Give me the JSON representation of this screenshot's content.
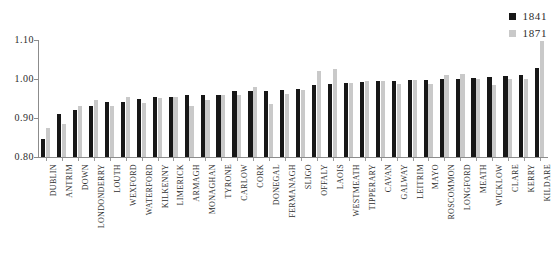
{
  "legend": {
    "position": "top-right",
    "items": [
      {
        "label": "1841",
        "color": "#171717",
        "name": "series-1841"
      },
      {
        "label": "1871",
        "color": "#c9c9c9",
        "name": "series-1871"
      }
    ]
  },
  "axis": {
    "y_ticks": [
      "1.10",
      "1.00",
      "0.90",
      "0.80"
    ],
    "y_min": 0.8,
    "y_max": 1.1
  },
  "chart_data": {
    "type": "bar",
    "title": "",
    "subtitle": "",
    "xlabel": "",
    "ylabel": "",
    "ylim": [
      0.8,
      1.1
    ],
    "grid": false,
    "legend_position": "top right",
    "categories": [
      "DUBLIN",
      "ANTRIM",
      "DOWN",
      "LONDONDERRY",
      "LOUTH",
      "WEXFORD",
      "WATERFORD",
      "KILKENNY",
      "LIMERICK",
      "ARMAGH",
      "MONAGHAN",
      "TYRONE",
      "CARLOW",
      "CORK",
      "DONEGAL",
      "FERMANAGH",
      "SLIGO",
      "OFFALY",
      "LAOIS",
      "WESTMEATH",
      "TIPPERARY",
      "CAVAN",
      "GALWAY",
      "LEITRIM",
      "MAYO",
      "ROSCOMMON",
      "LONGFORD",
      "MEATH",
      "WICKLOW",
      "CLARE",
      "KERRY",
      "KILDARE"
    ],
    "series": [
      {
        "name": "1841",
        "color": "#171717",
        "values": [
          0.845,
          0.91,
          0.92,
          0.93,
          0.94,
          0.94,
          0.95,
          0.955,
          0.955,
          0.958,
          0.96,
          0.96,
          0.968,
          0.97,
          0.97,
          0.972,
          0.975,
          0.985,
          0.988,
          0.99,
          0.992,
          0.995,
          0.995,
          0.998,
          0.998,
          1.0,
          1.0,
          1.002,
          1.005,
          1.008,
          1.01,
          1.028
        ]
      },
      {
        "name": "1871",
        "color": "#c9c9c9",
        "values": [
          0.875,
          0.885,
          0.93,
          0.947,
          0.932,
          0.955,
          0.938,
          0.952,
          0.955,
          0.93,
          0.945,
          0.958,
          0.96,
          0.98,
          0.935,
          0.962,
          0.972,
          1.02,
          1.025,
          0.99,
          0.995,
          0.995,
          0.988,
          0.998,
          0.988,
          1.01,
          1.012,
          1.0,
          0.985,
          1.0,
          1.0,
          1.098
        ]
      }
    ]
  }
}
